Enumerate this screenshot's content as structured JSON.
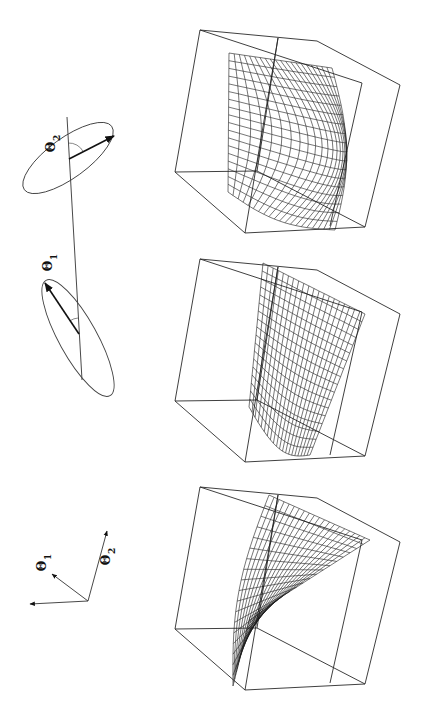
{
  "figure": {
    "orientation": "rotated-90-ccw",
    "ink_color": "#1a1a1a",
    "background": "#ffffff"
  },
  "rotation_diagram": {
    "axis_line": {
      "x1": 67,
      "y1": 117,
      "x2": 82,
      "y2": 380
    },
    "ellipses": [
      {
        "id": "theta2",
        "label": "Θ",
        "subscript": "2",
        "cx": 68,
        "cy": 158,
        "rx": 54,
        "ry": 20,
        "rotate": -36,
        "arrow": {
          "x1": 69,
          "y1": 159,
          "x2": 114,
          "y2": 136
        },
        "label_pos": {
          "x": 55,
          "y": 147
        }
      },
      {
        "id": "theta1",
        "label": "Θ",
        "subscript": "1",
        "cx": 78,
        "cy": 338,
        "rx": 66,
        "ry": 19,
        "rotate": 61,
        "arrow": {
          "x1": 79,
          "y1": 334,
          "x2": 45,
          "y2": 283
        },
        "label_pos": {
          "x": 52,
          "y": 266
        }
      }
    ]
  },
  "coordinate_axes": {
    "origin": {
      "x": 88,
      "y": 601
    },
    "axes": [
      {
        "id": "unlabeled",
        "label": "",
        "subscript": "",
        "x": 30,
        "y": 604
      },
      {
        "id": "theta1",
        "label": "Θ",
        "subscript": "1",
        "x": 52,
        "y": 574,
        "label_pos": {
          "x": 46,
          "y": 566
        }
      },
      {
        "id": "theta2",
        "label": "Θ",
        "subscript": "2",
        "x": 107,
        "y": 531,
        "label_pos": {
          "x": 110,
          "y": 560
        }
      }
    ]
  },
  "panels": [
    {
      "id": "panel-top",
      "dy": 0,
      "surface": "bulge"
    },
    {
      "id": "panel-middle",
      "dy": 229,
      "surface": "saddle"
    },
    {
      "id": "panel-bottom",
      "dy": 457,
      "surface": "twist"
    }
  ],
  "cube_template": {
    "outer": [
      [
        200,
        30
      ],
      [
        317,
        41
      ],
      [
        400,
        85
      ],
      [
        365,
        227
      ],
      [
        245,
        233
      ],
      [
        175,
        172
      ]
    ],
    "inner_edges": [
      [
        [
          200,
          30
        ],
        [
          362,
          83
        ]
      ],
      [
        [
          278,
          38
        ],
        [
          245,
          233
        ]
      ],
      [
        [
          362,
          83
        ],
        [
          330,
          226
        ]
      ],
      [
        [
          175,
          172
        ],
        [
          257,
          171
        ]
      ],
      [
        [
          257,
          171
        ],
        [
          365,
          227
        ]
      ],
      [
        [
          278,
          38
        ],
        [
          257,
          171
        ]
      ]
    ]
  }
}
